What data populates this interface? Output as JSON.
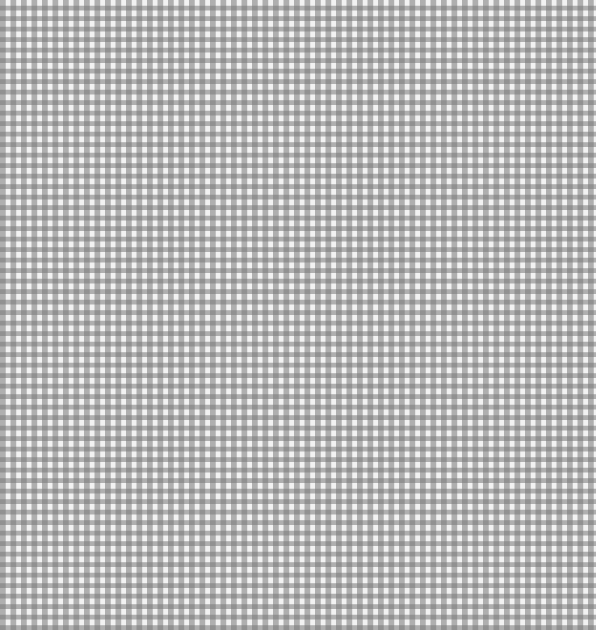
{
  "image": {
    "description": "Gray and white gingham check fabric pattern",
    "pattern": "gingham",
    "colors": {
      "light": "#f2f2f2",
      "mid": "#b5b5b5",
      "dark": "#7d7d7d"
    },
    "check_size_px": 10.5
  }
}
